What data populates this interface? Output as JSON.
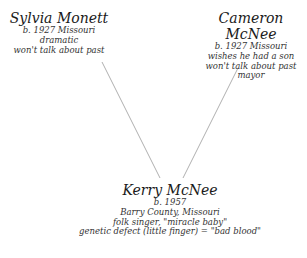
{
  "diagram": {
    "type": "family-tree",
    "nodes": [
      {
        "id": "sylvia",
        "name": "Sylvia Monett",
        "details": [
          "b. 1927 Missouri",
          "dramatic",
          "won't talk about past"
        ]
      },
      {
        "id": "cameron",
        "name": "Cameron McNee",
        "details": [
          "b. 1927 Missouri",
          "wishes he had a son",
          "won't talk about past",
          "mayor"
        ]
      },
      {
        "id": "kerry",
        "name": "Kerry McNee",
        "details": [
          "b. 1957",
          "Barry County, Missouri",
          "folk singer, \"miracle baby\"",
          "genetic defect (little finger) = \"bad blood\""
        ]
      }
    ],
    "edges": [
      {
        "from": "sylvia",
        "to": "kerry"
      },
      {
        "from": "cameron",
        "to": "kerry"
      }
    ],
    "line_color": "#b0b0b0"
  }
}
